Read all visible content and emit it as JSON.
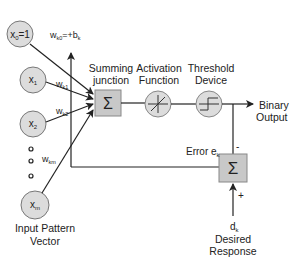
{
  "diagram": {
    "type": "adaline-perceptron",
    "inputs": [
      {
        "label": "x",
        "sub": "0",
        "suffix": "=1",
        "weight": "w",
        "weight_sub": "k0",
        "weight_suffix": "=+b",
        "weight_suffix_sub": "k"
      },
      {
        "label": "x",
        "sub": "1",
        "weight": "w",
        "weight_sub": "k1"
      },
      {
        "label": "x",
        "sub": "2",
        "weight": "w",
        "weight_sub": "k2"
      },
      {
        "label": "x",
        "sub": "m",
        "weight": "w",
        "weight_sub": "km"
      }
    ],
    "input_group_label_line1": "Input Pattern",
    "input_group_label_line2": "Vector",
    "summing_label_line1": "Summing",
    "summing_label_line2": "junction",
    "sigma": "Σ",
    "activation_label_line1": "Activation",
    "activation_label_line2": "Function",
    "threshold_label_line1": "Threshold",
    "threshold_label_line2": "Device",
    "output_label_line1": "Binary",
    "output_label_line2": "Output",
    "error_label": "Error e",
    "error_sub": "k",
    "minus_sign": "-",
    "plus_sign": "+",
    "desired_symbol": "d",
    "desired_sub": "k",
    "desired_label_line1": "Desired",
    "desired_label_line2": "Response",
    "colors": {
      "node_fill": "#dcdcdc",
      "box_fill": "#c8c8c8",
      "stroke": "#222222"
    }
  }
}
